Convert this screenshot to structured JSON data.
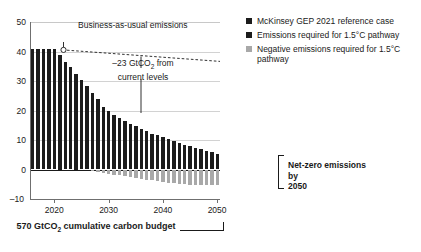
{
  "chart_data": {
    "type": "bar",
    "title": "",
    "xlabel": "",
    "ylabel": "",
    "ylim": [
      -10,
      50
    ],
    "xlim": [
      2015.5,
      2050.5
    ],
    "grid": true,
    "legend_position": "right",
    "y_ticks": [
      "50",
      "40",
      "30",
      "20",
      "10",
      "0",
      "–10"
    ],
    "y_tick_values": [
      50,
      40,
      30,
      20,
      10,
      0,
      -10
    ],
    "x_ticks": [
      "2020",
      "2030",
      "2040",
      "2050"
    ],
    "x_tick_values": [
      2020,
      2030,
      2040,
      2050
    ],
    "categories": [
      2016,
      2017,
      2018,
      2019,
      2020,
      2021,
      2022,
      2023,
      2024,
      2025,
      2026,
      2027,
      2028,
      2029,
      2030,
      2031,
      2032,
      2033,
      2034,
      2035,
      2036,
      2037,
      2038,
      2039,
      2040,
      2041,
      2042,
      2043,
      2044,
      2045,
      2046,
      2047,
      2048,
      2049,
      2050
    ],
    "series": [
      {
        "name": "Emissions required for 1.5°C pathway",
        "color": "#1c1c1c",
        "values": [
          40.7,
          40.7,
          40.7,
          40.7,
          40.7,
          38.9,
          36.6,
          34.9,
          32.5,
          30.4,
          28.3,
          25.9,
          23.9,
          21.3,
          19.9,
          18.4,
          17.3,
          16.4,
          15.4,
          14.6,
          13.7,
          12.9,
          12.2,
          11.6,
          11.0,
          10.3,
          9.7,
          9.0,
          8.4,
          7.8,
          7.3,
          6.8,
          6.3,
          5.8,
          5.4
        ]
      },
      {
        "name": "Negative emissions required for 1.5°C pathway",
        "color": "#a8a8a8",
        "values": [
          0,
          0,
          0,
          0,
          0,
          0,
          0,
          0,
          0,
          0,
          0,
          -0.6,
          -0.9,
          -1.2,
          -1.5,
          -1.8,
          -2.0,
          -2.3,
          -2.6,
          -2.9,
          -3.2,
          -3.4,
          -3.7,
          -4.0,
          -4.3,
          -4.5,
          -4.7,
          -4.9,
          -5.0,
          -5.1,
          -5.2,
          -5.3,
          -5.4,
          -5.4,
          -5.4
        ]
      },
      {
        "name": "McKinsey GEP 2021 reference case",
        "color": "#1c1c1c",
        "style": "dashed-line",
        "x": [
          2020,
          2050
        ],
        "values": [
          41.0,
          37.2
        ]
      }
    ],
    "annotations": [
      {
        "name": "bau-label",
        "text": "Business-as-usual emissions",
        "x": 2020,
        "y": 41.0
      },
      {
        "name": "drop-label",
        "text": "–23 GtCO2 from current levels",
        "x": 2030,
        "y": 19.9
      },
      {
        "name": "netzero-label",
        "text": "Net-zero emissions by 2050",
        "x": 2050,
        "y": 0
      },
      {
        "name": "budget-label",
        "text": "570 GtCO2 cumulative carbon budget"
      }
    ]
  },
  "legend": {
    "items": [
      {
        "label": "McKinsey GEP 2021 reference case",
        "color": "#1c1c1c"
      },
      {
        "label": "Emissions required for 1.5°C pathway",
        "color": "#1c1c1c"
      },
      {
        "label": "Negative emissions required for 1.5°C pathway",
        "color": "#a8a8a8"
      }
    ]
  },
  "annotations": {
    "bau": "Business-as-usual emissions",
    "drop_line1": "–23 GtCO",
    "drop_sub": "2",
    "drop_line1_tail": " from",
    "drop_line2": "current levels",
    "netzero_line1": "Net-zero emissions by",
    "netzero_line2": "2050",
    "budget_prefix": "570 GtCO",
    "budget_sub": "2",
    "budget_suffix": " cumulative carbon budget"
  },
  "axis": {
    "y_labels": [
      "50",
      "40",
      "30",
      "20",
      "10",
      "0",
      "–10"
    ],
    "x_labels": [
      "2020",
      "2030",
      "2040",
      "2050"
    ]
  },
  "colors": {
    "positive_bar": "#1c1c1c",
    "negative_bar": "#a8a8a8",
    "gridline": "#d2d2d2",
    "axis": "#6f6f6f",
    "text": "#1a1a1a"
  }
}
